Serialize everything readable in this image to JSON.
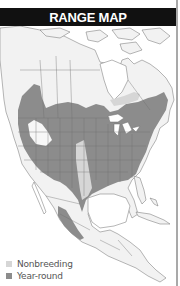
{
  "header": {
    "title": "RANGE MAP"
  },
  "colors": {
    "header_bg": "#111111",
    "header_text": "#ffffff",
    "land": "#f2f2f2",
    "water": "#ffffff",
    "border_lines": "#6e6e6e",
    "nonbreeding": "#d6d6d6",
    "year_round": "#8c8c8c",
    "frame_border": "#a9a9a9"
  },
  "legend": {
    "items": [
      {
        "label": "Nonbreeding",
        "color": "#d6d6d6"
      },
      {
        "label": "Year-round",
        "color": "#8c8c8c"
      }
    ]
  },
  "map": {
    "region": "North America",
    "layers": [
      "Nonbreeding",
      "Year-round"
    ]
  }
}
